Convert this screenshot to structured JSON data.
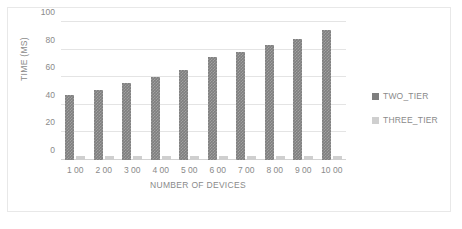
{
  "chart_data": {
    "type": "bar",
    "title": "",
    "xlabel": "NUMBER OF DEVICES",
    "ylabel": "TIME (MS)",
    "categories": [
      "1 00",
      "2 00",
      "3 00",
      "4 00",
      "5 00",
      "6 00",
      "7 00",
      "8 00",
      "9 00",
      "10 00"
    ],
    "series": [
      {
        "name": "TWO_TIER",
        "color": "#7f7f7f",
        "values": [
          47,
          51,
          56,
          60,
          65,
          75,
          78.5,
          83.5,
          88,
          94
        ]
      },
      {
        "name": "THREE_TIER",
        "color": "#cfcfcf",
        "values": [
          3,
          3,
          3,
          3,
          3,
          3,
          3,
          3,
          3,
          3
        ]
      }
    ],
    "ylim": [
      0,
      100
    ],
    "y_ticks": [
      0,
      20,
      40,
      60,
      80,
      100
    ],
    "y_tick_labels": [
      "0",
      "20",
      "40",
      "60",
      "80",
      "100"
    ],
    "grid": true,
    "legend_position": "right",
    "axis_color": "#8a8a8a",
    "gridline_color": "#e4e4e4",
    "border_color": "#e8e8e8",
    "background": "#ffffff"
  }
}
